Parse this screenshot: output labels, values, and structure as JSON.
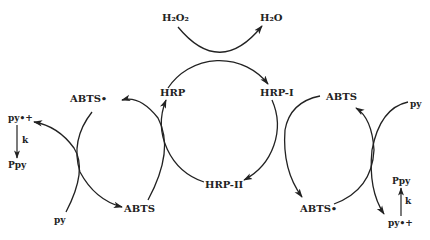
{
  "diagram": {
    "type": "reaction-cycle",
    "colors": {
      "line": "#222222",
      "background": "#ffffff"
    },
    "top_reaction": {
      "reactant": "H₂O₂",
      "product": "H₂O"
    },
    "enzyme_cycle": {
      "nodes": [
        "HRP",
        "HRP-I",
        "HRP-II"
      ],
      "edges": [
        {
          "from": "HRP",
          "to": "HRP-I",
          "via": "H₂O₂ → H₂O"
        },
        {
          "from": "HRP-I",
          "to": "HRP-II",
          "via": "ABTS → ABTS•"
        },
        {
          "from": "HRP-II",
          "to": "HRP",
          "via": "ABTS → ABTS•"
        }
      ]
    },
    "left_cycle": {
      "top_label": "ABTS•",
      "bottom_label": "ABTS",
      "substrate": "py",
      "radical": "py•+",
      "rate": "k",
      "product": "Ppy"
    },
    "right_cycle": {
      "top_label": "ABTS",
      "bottom_label": "ABTS•",
      "substrate": "py",
      "radical": "py•+",
      "rate": "k",
      "product": "Ppy"
    }
  }
}
